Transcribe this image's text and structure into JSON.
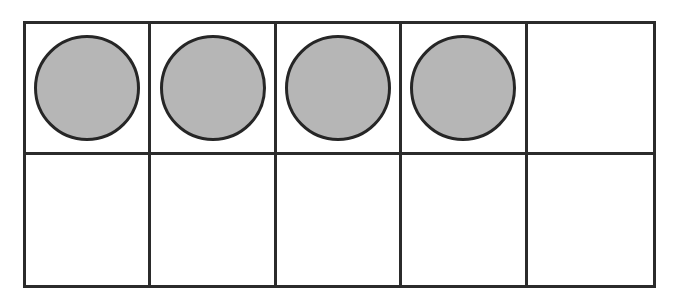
{
  "figure": {
    "name": "ten-frame",
    "type": "ten-frame-counter-diagram",
    "rows": 2,
    "columns": 5,
    "total_cells": 10,
    "filled_count": 4,
    "empty_count": 6,
    "colors": {
      "background": "#ffffff",
      "grid_line": "#2b2b2b",
      "counter_fill": "#b6b6b6",
      "counter_outline": "#262626"
    },
    "grid": {
      "border_width_px": 3,
      "outer_left_px": 23,
      "outer_top_px": 21,
      "outer_width_px": 633,
      "outer_height_px": 267,
      "counter_diameter_px": 106
    }
  },
  "cells": [
    {
      "id": "cell-r1c1",
      "row": 1,
      "column": 1,
      "filled": true,
      "counter_label": "counter"
    },
    {
      "id": "cell-r1c2",
      "row": 1,
      "column": 2,
      "filled": true,
      "counter_label": "counter"
    },
    {
      "id": "cell-r1c3",
      "row": 1,
      "column": 3,
      "filled": true,
      "counter_label": "counter"
    },
    {
      "id": "cell-r1c4",
      "row": 1,
      "column": 4,
      "filled": true,
      "counter_label": "counter"
    },
    {
      "id": "cell-r1c5",
      "row": 1,
      "column": 5,
      "filled": false,
      "counter_label": ""
    },
    {
      "id": "cell-r2c1",
      "row": 2,
      "column": 1,
      "filled": false,
      "counter_label": ""
    },
    {
      "id": "cell-r2c2",
      "row": 2,
      "column": 2,
      "filled": false,
      "counter_label": ""
    },
    {
      "id": "cell-r2c3",
      "row": 2,
      "column": 3,
      "filled": false,
      "counter_label": ""
    },
    {
      "id": "cell-r2c4",
      "row": 2,
      "column": 4,
      "filled": false,
      "counter_label": ""
    },
    {
      "id": "cell-r2c5",
      "row": 2,
      "column": 5,
      "filled": false,
      "counter_label": ""
    }
  ]
}
